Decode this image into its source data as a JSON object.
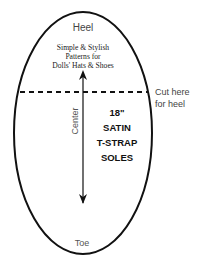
{
  "diagram": {
    "type": "sole-pattern",
    "labels": {
      "heel": "Heel",
      "toe": "Toe",
      "center": "Center",
      "cut_line_1": "Cut here",
      "cut_line_2": "for heel"
    },
    "publisher": {
      "line1": "Simple & Stylish",
      "line2": "Patterns for",
      "line3": "Dolls' Hats & Shoes"
    },
    "title": {
      "line1": "18\"",
      "line2": "SATIN",
      "line3": "T-STRAP",
      "line4": "SOLES"
    },
    "colors": {
      "stroke": "#111111",
      "label": "#555555",
      "text": "#222222"
    }
  }
}
